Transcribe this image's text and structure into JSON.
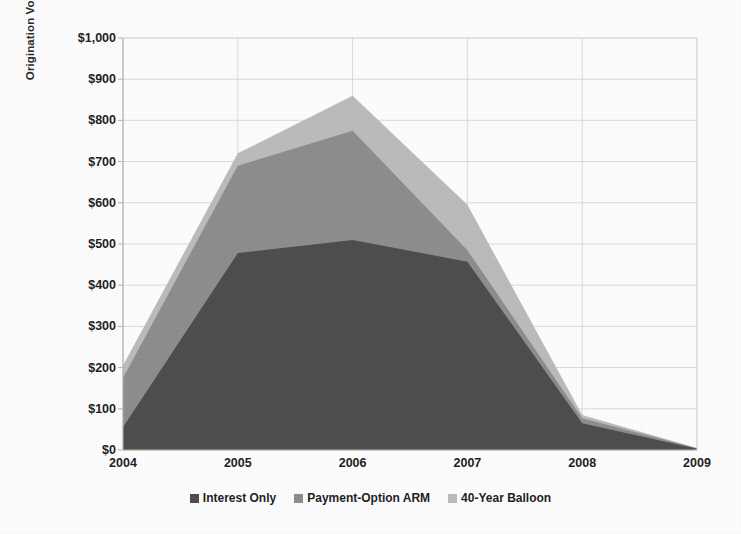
{
  "chart_data": {
    "type": "area",
    "title": "",
    "xlabel": "",
    "ylabel": "Origination Volume ($ Billions)",
    "categories": [
      "2004",
      "2005",
      "2006",
      "2007",
      "2008",
      "2009"
    ],
    "x": [
      2004,
      2005,
      2006,
      2007,
      2008,
      2009
    ],
    "xlim": [
      2004,
      2009
    ],
    "ylim": [
      0,
      1000
    ],
    "stacked": true,
    "grid": true,
    "legend_position": "bottom",
    "ytick_labels": [
      "$0",
      "$100",
      "$200",
      "$300",
      "$400",
      "$500",
      "$600",
      "$700",
      "$800",
      "$900",
      "$1,000"
    ],
    "ytick_values": [
      0,
      100,
      200,
      300,
      400,
      500,
      600,
      700,
      800,
      900,
      1000
    ],
    "xtick_labels": [
      "2004",
      "2005",
      "2006",
      "2007",
      "2008",
      "2009"
    ],
    "series": [
      {
        "name": "Interest Only",
        "color": "#4f4f4f",
        "values": [
          55,
          478,
          510,
          457,
          65,
          3
        ]
      },
      {
        "name": "Payment-Option ARM",
        "color": "#8f8f8f",
        "values": [
          120,
          212,
          265,
          28,
          12,
          1
        ]
      },
      {
        "name": "40-Year Balloon",
        "color": "#bdbdbd",
        "values": [
          30,
          30,
          85,
          110,
          8,
          1
        ]
      }
    ],
    "cumulative_tops": [
      [
        55,
        478,
        510,
        457,
        65,
        3
      ],
      [
        175,
        690,
        775,
        485,
        77,
        4
      ],
      [
        205,
        720,
        860,
        595,
        85,
        5
      ]
    ]
  },
  "legend": {
    "items": [
      {
        "label": "Interest Only",
        "color": "#4f4f4f"
      },
      {
        "label": "Payment-Option ARM",
        "color": "#8f8f8f"
      },
      {
        "label": "40-Year Balloon",
        "color": "#bdbdbd"
      }
    ]
  },
  "axes": {
    "y_axis_title": "Origination Volume ($ Billions)"
  },
  "colors": {
    "grid": "#d9d9d9",
    "axis": "#b3b3b3",
    "text": "#1f1f1f",
    "background": "#ffffff"
  }
}
